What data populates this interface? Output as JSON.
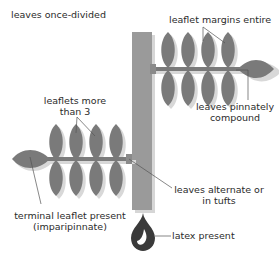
{
  "colors": {
    "stem": "#9a9a9a",
    "leaf": "#7a7a7a",
    "shadow": "#d4d4d4",
    "line": "#555555",
    "latex": "#3a3a3a",
    "text": "#2b2b2b"
  },
  "labels": {
    "leaves_once_divided": "leaves once-divided",
    "leaflet_margins_entire": "leaflet margins entire",
    "leaves_pinnately_compound_1": "leaves pinnately",
    "leaves_pinnately_compound_2": "compound",
    "leaflets_more_than_3_1": "leaflets more",
    "leaflets_more_than_3_2": "than 3",
    "leaves_alternate_1": "leaves alternate or",
    "leaves_alternate_2": "in tufts",
    "terminal_leaflet_1": "terminal leaflet present",
    "terminal_leaflet_2": "(imparipinnate)",
    "latex_present": "latex present"
  },
  "icons": {
    "latex": "latex-drop-icon"
  }
}
